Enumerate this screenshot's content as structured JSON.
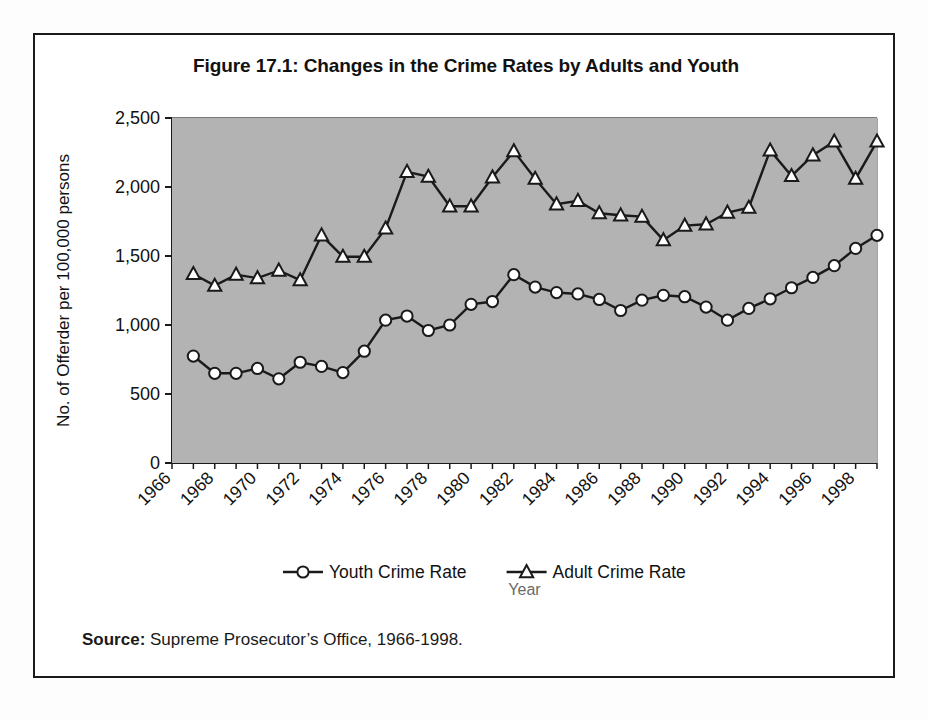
{
  "figure": {
    "title": "Figure 17.1: Changes in the Crime Rates by Adults and Youth",
    "source_label": "Source:",
    "source_text": "Supreme Prosecutor’s Office, 1966-1998.",
    "plot_background_color": "#b3b3b3",
    "line_color": "#1a1a1a",
    "marker_fill_color": "#ffffff",
    "border_color": "#1a1a1a"
  },
  "chart_data": {
    "type": "line",
    "title": "Figure 17.1: Changes in the Crime Rates by Adults and Youth",
    "xlabel": "Year",
    "ylabel": "No. of Offerder per 100,000 persons",
    "xlim": [
      1966,
      1999
    ],
    "ylim": [
      0,
      2500
    ],
    "yticks": [
      0,
      500,
      1000,
      1500,
      2000,
      2500
    ],
    "ytick_labels": [
      "0",
      "500",
      "1,000",
      "1,500",
      "2,000",
      "2,500"
    ],
    "xticks": [
      1966,
      1968,
      1970,
      1972,
      1974,
      1976,
      1978,
      1980,
      1982,
      1984,
      1986,
      1988,
      1990,
      1992,
      1994,
      1996,
      1998
    ],
    "xtick_labels": [
      "1966",
      "1968",
      "1970",
      "1972",
      "1974",
      "1976",
      "1978",
      "1980",
      "1982",
      "1984",
      "1986",
      "1988",
      "1990",
      "1992",
      "1994",
      "1996",
      "1998"
    ],
    "xtick_rotation": 45,
    "grid": "horizontal",
    "legend_position": "bottom",
    "x": [
      1967,
      1968,
      1969,
      1970,
      1971,
      1972,
      1973,
      1974,
      1975,
      1976,
      1977,
      1978,
      1979,
      1980,
      1981,
      1982,
      1983,
      1984,
      1985,
      1986,
      1987,
      1988,
      1989,
      1990,
      1991,
      1992,
      1993,
      1994,
      1995,
      1996,
      1997,
      1998,
      1999
    ],
    "series": [
      {
        "name": "Youth Crime Rate",
        "marker": "circle",
        "values": [
          775,
          650,
          650,
          685,
          610,
          730,
          700,
          655,
          810,
          1035,
          1065,
          960,
          1000,
          1150,
          1170,
          1365,
          1275,
          1235,
          1225,
          1185,
          1105,
          1180,
          1215,
          1205,
          1130,
          1035,
          1120,
          1190,
          1270,
          1345,
          1430,
          1555,
          1650
        ]
      },
      {
        "name": "Adult Crime Rate",
        "marker": "triangle",
        "values": [
          1370,
          1285,
          1365,
          1340,
          1395,
          1325,
          1650,
          1495,
          1495,
          1700,
          2110,
          2075,
          1860,
          1860,
          2070,
          2260,
          2060,
          1875,
          1900,
          1810,
          1795,
          1785,
          1615,
          1720,
          1730,
          1815,
          1850,
          2265,
          2080,
          2230,
          2330,
          2060,
          2330
        ]
      }
    ],
    "legend": [
      {
        "label": "Youth Crime Rate",
        "marker": "circle"
      },
      {
        "label": "Adult Crime Rate",
        "marker": "triangle"
      }
    ]
  }
}
